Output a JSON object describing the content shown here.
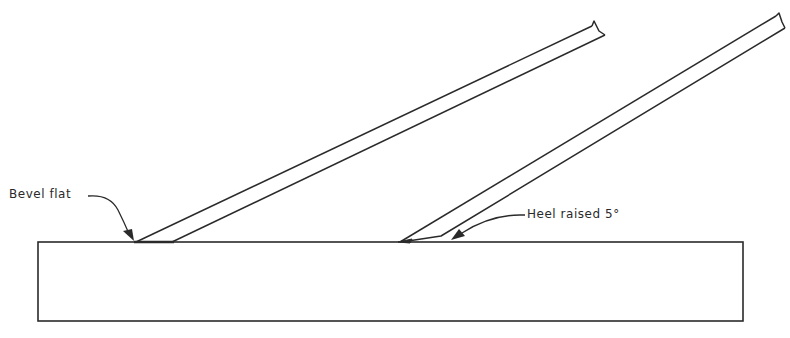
{
  "figure": {
    "labels": {
      "bevel_flat": "Bevel flat",
      "heel_raised": "Heel raised 5°"
    },
    "colors": {
      "line": "#2a2a2a",
      "background": "#ffffff"
    }
  }
}
